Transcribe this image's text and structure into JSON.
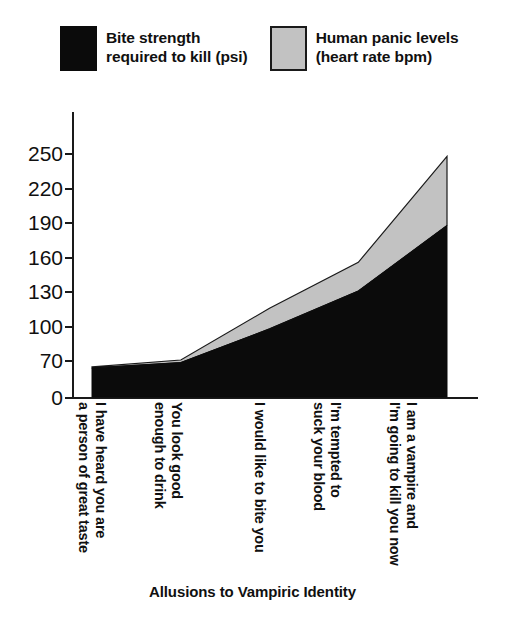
{
  "chart_data": {
    "type": "area",
    "stacked": true,
    "title": "",
    "xlabel": "Allusions to Vampiric Identity",
    "ylabel": "",
    "grid": false,
    "legend_position": "top",
    "ylim": [
      0,
      250
    ],
    "yticks": [
      0,
      70,
      100,
      130,
      160,
      190,
      220,
      250
    ],
    "ytick_labels": [
      "0",
      "70",
      "100",
      "130",
      "160",
      "190",
      "220",
      "250"
    ],
    "y_axis_note": "broken axis: gap between 0 and 70, then even 30-unit steps",
    "categories": [
      "I have heard you are\na person of great taste",
      "You look good\nenough to drink",
      "I would like to bite you",
      "I'm tempted to\nsuck your blood",
      "I am a vampire and\nI'm going to kill you now"
    ],
    "series": [
      {
        "name": "Bite strength\nrequired to kill (psi)",
        "color": "#0b0b0b",
        "values": [
          55,
          65,
          97,
          130,
          187
        ]
      },
      {
        "name": "Human panic levels\n(heart rate bpm)",
        "color": "#c2c2c2",
        "values": [
          2,
          5,
          18,
          25,
          60
        ]
      }
    ],
    "cumulative_tops": [
      57,
      70,
      115,
      155,
      247
    ]
  },
  "legend": {
    "items": [
      {
        "label": "Bite strength\nrequired to kill (psi)",
        "swatch": "black"
      },
      {
        "label": "Human panic levels\n(heart rate bpm)",
        "swatch": "gray"
      }
    ]
  },
  "axis": {
    "y": {
      "t0": "0",
      "t1": "70",
      "t2": "100",
      "t3": "130",
      "t4": "160",
      "t5": "190",
      "t6": "220",
      "t7": "250"
    },
    "x": {
      "title": "Allusions to Vampiric Identity",
      "c0": "I have heard you are\na person of great taste",
      "c1": "You look good\nenough to drink",
      "c2": "I would like to bite you",
      "c3": "I'm tempted to\nsuck your blood",
      "c4": "I am a vampire and\nI'm going to kill you now"
    }
  },
  "colors": {
    "series_black": "#0b0b0b",
    "series_gray": "#c2c2c2",
    "axis": "#1a1a1a",
    "background": "#ffffff"
  }
}
